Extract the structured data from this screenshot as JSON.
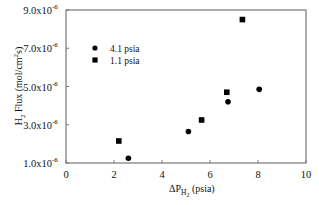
{
  "chart_data": {
    "type": "scatter",
    "title": "",
    "xlabel": "ΔP_H2 (psia)",
    "ylabel": "H2 Flux (mol/cm²s)",
    "xlim": [
      0,
      10
    ],
    "ylim": [
      1e-06,
      9e-06
    ],
    "x_ticks": [
      0,
      2,
      4,
      6,
      8,
      10
    ],
    "x_tick_labels": [
      "0",
      "2",
      "4",
      "6",
      "8",
      "10"
    ],
    "y_ticks": [
      1e-06,
      3e-06,
      5e-06,
      7e-06,
      9e-06
    ],
    "y_tick_labels": [
      "1.0x10",
      "3.0x10",
      "5.0x10",
      "7.0x10",
      "9.0x10"
    ],
    "y_tick_exponent": "-6",
    "grid": false,
    "legend_position": "upper-left",
    "series": [
      {
        "name": "4.1 psia",
        "marker": "circle",
        "color": "#000000",
        "points": [
          {
            "x": 2.6,
            "y": 1.25e-06
          },
          {
            "x": 5.1,
            "y": 2.65e-06
          },
          {
            "x": 6.75,
            "y": 4.2e-06
          },
          {
            "x": 8.05,
            "y": 4.85e-06
          }
        ]
      },
      {
        "name": "1.1 psia",
        "marker": "square",
        "color": "#000000",
        "points": [
          {
            "x": 2.2,
            "y": 2.15e-06
          },
          {
            "x": 5.65,
            "y": 3.25e-06
          },
          {
            "x": 6.7,
            "y": 4.7e-06
          },
          {
            "x": 7.35,
            "y": 8.5e-06
          }
        ]
      }
    ]
  },
  "labels": {
    "xlabel_main": "ΔP",
    "xlabel_sub": "H",
    "xlabel_subsub": "2",
    "xlabel_unit": " (psia)",
    "ylabel_pre": "H",
    "ylabel_sub": "2",
    "ylabel_mid": " Flux (mol/cm",
    "ylabel_sup": "2",
    "ylabel_post": "s)"
  }
}
